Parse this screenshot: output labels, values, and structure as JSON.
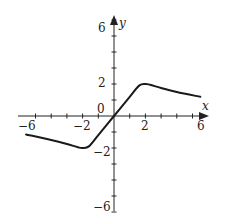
{
  "chart_data": {
    "type": "line",
    "title": "",
    "xlabel": "x",
    "ylabel": "y",
    "xlim": [
      -6,
      6
    ],
    "ylim": [
      -6,
      6
    ],
    "grid": false,
    "x_tick_labels": [
      "-6",
      "-2",
      "2",
      "6"
    ],
    "y_tick_labels": [
      "6",
      "2",
      "0",
      "-2",
      "-6"
    ],
    "x_ticks": [
      -5,
      -4,
      -3,
      -2,
      -1,
      1,
      2,
      3,
      4,
      5
    ],
    "y_ticks": [
      -5,
      -4,
      -3,
      -2,
      -1,
      1,
      2,
      3,
      4,
      5
    ],
    "series": [
      {
        "name": "f(x)",
        "x": [
          -5.6,
          -4,
          -3,
          -2.3,
          -2,
          -1.6,
          -1,
          0,
          1,
          1.6,
          2,
          2.3,
          3,
          4,
          5.5
        ],
        "y": [
          -1.15,
          -1.5,
          -1.75,
          -1.95,
          -2,
          -1.9,
          -1.2,
          0,
          1.2,
          1.9,
          2,
          1.95,
          1.75,
          1.5,
          1.2
        ]
      }
    ],
    "annotations": [
      "0"
    ]
  },
  "labels": {
    "x_axis": "x",
    "y_axis": "y",
    "origin": "0",
    "x_neg6": "−6",
    "x_neg2": "−2",
    "x_pos2": "2",
    "x_pos6": "6",
    "y_pos6": "6",
    "y_pos2": "2",
    "y_neg2": "−2",
    "y_neg6": "−6"
  },
  "colors": {
    "axis": "#222222",
    "curve": "#1a1a1a",
    "background": "#ffffff"
  }
}
